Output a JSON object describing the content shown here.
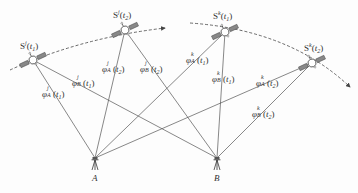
{
  "diagram": {
    "type": "gnss-double-difference-observation",
    "satellites": [
      {
        "id": "Sj_t1",
        "name": "S",
        "sat": "j",
        "epoch": "t1",
        "label": "S^j(t1)",
        "pos": [
          33,
          60
        ],
        "label_pos": [
          20,
          40
        ]
      },
      {
        "id": "Sj_t2",
        "name": "S",
        "sat": "j",
        "epoch": "t2",
        "label": "S^j(t2)",
        "pos": [
          125,
          30
        ],
        "label_pos": [
          113,
          9
        ]
      },
      {
        "id": "Sk_t1",
        "name": "S",
        "sat": "k",
        "epoch": "t1",
        "label": "S^k(t1)",
        "pos": [
          225,
          32
        ],
        "label_pos": [
          213,
          10
        ]
      },
      {
        "id": "Sk_t2",
        "name": "S",
        "sat": "k",
        "epoch": "t2",
        "label": "S^k(t2)",
        "pos": [
          312,
          63
        ],
        "label_pos": [
          304,
          42
        ]
      }
    ],
    "stations": [
      {
        "id": "A",
        "label": "A",
        "pos": [
          95,
          162
        ]
      },
      {
        "id": "B",
        "label": "B",
        "pos": [
          217,
          162
        ]
      }
    ],
    "observations": [
      {
        "from": "Sj_t1",
        "to": "A",
        "phi": "φ",
        "sat": "j",
        "stn": "A",
        "epoch": "t1",
        "label": "φ^j_A(t1)",
        "label_pos": [
          42,
          88
        ]
      },
      {
        "from": "Sj_t1",
        "to": "B",
        "phi": "φ",
        "sat": "j",
        "stn": "B",
        "epoch": "t1",
        "label": "φ^j_B(t1)",
        "label_pos": [
          72,
          77
        ]
      },
      {
        "from": "Sj_t2",
        "to": "A",
        "phi": "φ",
        "sat": "j",
        "stn": "A",
        "epoch": "t2",
        "label": "φ^j_A(t2)",
        "label_pos": [
          102,
          63
        ]
      },
      {
        "from": "Sj_t2",
        "to": "B",
        "phi": "φ",
        "sat": "j",
        "stn": "B",
        "epoch": "t2",
        "label": "φ^j_B(t2)",
        "label_pos": [
          140,
          63
        ]
      },
      {
        "from": "Sk_t1",
        "to": "A",
        "phi": "φ",
        "sat": "k",
        "stn": "A",
        "epoch": "t1",
        "label": "φ^k_A(t1)",
        "label_pos": [
          186,
          54
        ]
      },
      {
        "from": "Sk_t1",
        "to": "B",
        "phi": "φ",
        "sat": "k",
        "stn": "B",
        "epoch": "t1",
        "label": "φ^k_B(t1)",
        "label_pos": [
          212,
          73
        ]
      },
      {
        "from": "Sk_t2",
        "to": "A",
        "phi": "φ",
        "sat": "k",
        "stn": "A",
        "epoch": "t2",
        "label": "φ^k_A(t2)",
        "label_pos": [
          256,
          77
        ]
      },
      {
        "from": "Sk_t2",
        "to": "B",
        "phi": "φ",
        "sat": "k",
        "stn": "B",
        "epoch": "t2",
        "label": "φ^k_B(t2)",
        "label_pos": [
          252,
          108
        ]
      }
    ],
    "orbits": [
      {
        "id": "orbit-j",
        "path": "M 10 70 Q 80 38 165 28",
        "arrow_at": [
          165,
          28
        ]
      },
      {
        "id": "orbit-k",
        "path": "M 190 23 Q 290 30 350 87",
        "arrow_at": [
          350,
          87
        ]
      }
    ],
    "colors": {
      "line": "#555555",
      "text": "#333333",
      "background": "#fdfdfd"
    }
  }
}
